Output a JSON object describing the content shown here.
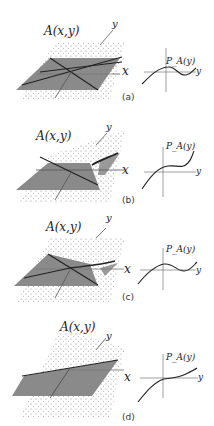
{
  "panels": [
    {
      "id": "a",
      "caption": "(a)",
      "surface_label": "A(x,y)",
      "x_label": "x",
      "y_label": "y",
      "graph_label": "P_A(y)",
      "graph_y": "y"
    },
    {
      "id": "b",
      "caption": "(b)",
      "surface_label": "A(x,y)",
      "x_label": "x",
      "y_label": "y",
      "graph_label": "P_A(y)",
      "graph_y": "y"
    },
    {
      "id": "c",
      "caption": "(c)",
      "surface_label": "A(x,y)",
      "x_label": "x",
      "y_label": "y",
      "graph_label": "P_A(y)",
      "graph_y": "y"
    },
    {
      "id": "d",
      "caption": "(d)",
      "surface_label": "A(x,y)",
      "x_label": "x",
      "y_label": "y",
      "graph_label": "P_A(y)",
      "graph_y": "y"
    }
  ],
  "colors": {
    "plane": "#8a8a8a",
    "surface_dots": "#999999",
    "line": "#222222"
  }
}
